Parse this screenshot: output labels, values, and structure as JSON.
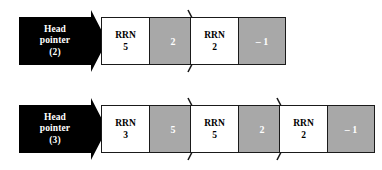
{
  "diagram": {
    "colors": {
      "pointer_block": "#000000",
      "link_field": "#a8a8a8",
      "data_field": "#ffffff",
      "outline": "#1a1a1a",
      "background": "#ffffff"
    },
    "field_label": "RRN",
    "rows": [
      {
        "head_pointer": {
          "line1": "Head",
          "line2": "pointer",
          "line3": "(2)",
          "value": "2"
        },
        "nodes": [
          {
            "field_label": "RRN",
            "rrn": "5",
            "link": "2",
            "has_arrow": true
          },
          {
            "field_label": "RRN",
            "rrn": "2",
            "link": "– 1",
            "has_arrow": false
          }
        ]
      },
      {
        "head_pointer": {
          "line1": "Head",
          "line2": "pointer",
          "line3": "(3)",
          "value": "3"
        },
        "nodes": [
          {
            "field_label": "RRN",
            "rrn": "3",
            "link": "5",
            "has_arrow": true
          },
          {
            "field_label": "RRN",
            "rrn": "5",
            "link": "2",
            "has_arrow": true
          },
          {
            "field_label": "RRN",
            "rrn": "2",
            "link": "– 1",
            "has_arrow": false
          }
        ]
      }
    ]
  }
}
